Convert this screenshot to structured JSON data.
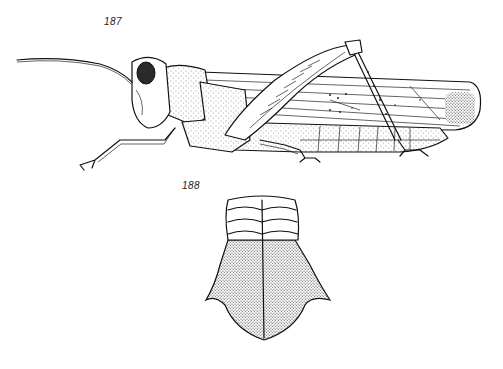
{
  "figures": [
    {
      "label": "187",
      "subject": "grasshopper-lateral-view",
      "parts": [
        "antenna",
        "head",
        "compound-eye",
        "pronotum",
        "tegmen",
        "hind-femur",
        "hind-tibia",
        "abdomen",
        "fore-leg",
        "middle-leg"
      ]
    },
    {
      "label": "188",
      "subject": "pronotum-dorsal-view",
      "parts": [
        "anterior-ridges",
        "median-carina",
        "posterior-lobe"
      ]
    }
  ],
  "colors": {
    "ink": "#111111",
    "paper": "#ffffff"
  }
}
